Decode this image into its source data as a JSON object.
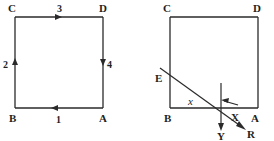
{
  "figure": {
    "stroke_color": "#2a2a2a",
    "background_color": "#ffffff"
  },
  "left_figure": {
    "name": "square-with-numbered-vectors",
    "vertices": {
      "C": {
        "label": "C",
        "x": 15,
        "y": 17
      },
      "D": {
        "label": "D",
        "x": 103,
        "y": 17
      },
      "A": {
        "label": "A",
        "x": 103,
        "y": 108
      },
      "B": {
        "label": "B",
        "x": 15,
        "y": 108
      }
    },
    "vertex_labels": [
      {
        "label": "C",
        "tx": 8,
        "ty": 12
      },
      {
        "label": "D",
        "tx": 99,
        "ty": 12
      },
      {
        "label": "A",
        "tx": 99,
        "ty": 122
      },
      {
        "label": "B",
        "tx": 9,
        "ty": 122
      }
    ],
    "edges": [
      {
        "id": "1",
        "label": "1",
        "from": "A",
        "to": "B",
        "direction": "left",
        "label_x": 56,
        "label_y": 122
      },
      {
        "id": "2",
        "label": "2",
        "from": "B",
        "to": "C",
        "direction": "up",
        "label_x": 4,
        "label_y": 64
      },
      {
        "id": "3",
        "label": "3",
        "from": "C",
        "to": "D",
        "direction": "right",
        "label_x": 57,
        "label_y": 12
      },
      {
        "id": "4",
        "label": "4",
        "from": "D",
        "to": "A",
        "direction": "down",
        "label_x": 106,
        "label_y": 64
      }
    ]
  },
  "right_figure": {
    "name": "square-with-transversal",
    "vertices": {
      "C": {
        "label": "C",
        "x": 170,
        "y": 17
      },
      "D": {
        "label": "D",
        "x": 258,
        "y": 17
      },
      "A": {
        "label": "A",
        "x": 258,
        "y": 108
      },
      "B": {
        "label": "B",
        "x": 170,
        "y": 108
      }
    },
    "vertex_labels": [
      {
        "label": "C",
        "tx": 163,
        "ty": 12
      },
      {
        "label": "D",
        "tx": 254,
        "ty": 12
      },
      {
        "label": "A",
        "tx": 252,
        "ty": 122
      },
      {
        "label": "B",
        "tx": 164,
        "ty": 122
      }
    ],
    "points": [
      {
        "label": "E",
        "tx": 157,
        "ty": 81,
        "desc": "point on left edge where transversal crosses"
      },
      {
        "label": "Y",
        "tx": 217,
        "ty": 139,
        "desc": "end of downward ray"
      },
      {
        "label": "R",
        "tx": 240,
        "ty": 136,
        "desc": "end of diagonal ray"
      },
      {
        "label": "X",
        "tx": 231,
        "ty": 124,
        "desc": "angle between bottom edge and ray"
      }
    ],
    "angle_labels": [
      {
        "label": "x",
        "tx": 190,
        "ty": 106,
        "desc": "angle at B between BE and BA"
      },
      {
        "label": "X",
        "tx": 231,
        "ty": 124,
        "desc": "angle at intersection toward R"
      }
    ],
    "rays": [
      {
        "id": "transversal-E-R",
        "from": [
          162,
          70
        ],
        "to": [
          245,
          130
        ],
        "arrow": "R"
      },
      {
        "id": "vertical-Y",
        "from": [
          221,
          85
        ],
        "to": [
          221,
          130
        ],
        "arrow": "Y"
      },
      {
        "id": "bottom-edge-arrow",
        "from": [
          236,
          104
        ],
        "to": [
          219,
          100
        ],
        "arrow": "left-up"
      }
    ]
  }
}
